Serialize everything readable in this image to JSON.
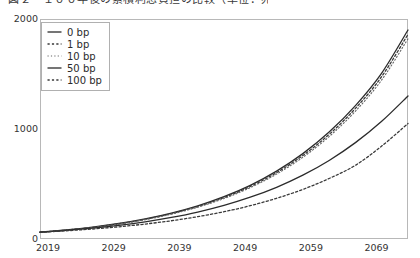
{
  "chart_data": {
    "type": "line",
    "title": "図２　１００年後の累積利息負担の比較（単位：兆円）",
    "xlabel": "",
    "ylabel": "",
    "xlim": [
      2019,
      2075
    ],
    "ylim": [
      0,
      2000
    ],
    "grid": false,
    "legend_position": "upper-left",
    "xticks": [
      "2019",
      "2029",
      "2039",
      "2049",
      "2059",
      "2069"
    ],
    "xtick_values": [
      2019,
      2029,
      2039,
      2049,
      2059,
      2069
    ],
    "yticks": [
      "0",
      "1000",
      "2000"
    ],
    "ytick_values": [
      0,
      1000,
      2000
    ],
    "x": [
      2019,
      2023,
      2027,
      2031,
      2035,
      2039,
      2043,
      2047,
      2051,
      2055,
      2059,
      2063,
      2067,
      2071,
      2075
    ],
    "series": [
      {
        "name": "0 bp",
        "style": "solid",
        "color": "#2b2b2b",
        "values": [
          62,
          82,
          108,
          141,
          183,
          236,
          302,
          385,
          488,
          617,
          776,
          972,
          1213,
          1509,
          1900
        ]
      },
      {
        "name": "1 bp",
        "style": "dotted",
        "color": "#3a3a3a",
        "values": [
          62,
          81,
          106,
          138,
          179,
          231,
          295,
          376,
          477,
          603,
          759,
          951,
          1187,
          1477,
          1860
        ]
      },
      {
        "name": "10 bp",
        "style": "dotted-fine",
        "color": "#666666",
        "values": [
          62,
          80,
          104,
          135,
          175,
          226,
          289,
          368,
          467,
          590,
          743,
          931,
          1162,
          1446,
          1820
        ]
      },
      {
        "name": "50 bp",
        "style": "solid",
        "color": "#2b2b2b",
        "values": [
          62,
          78,
          98,
          124,
          156,
          196,
          245,
          306,
          380,
          470,
          580,
          714,
          876,
          1070,
          1300
        ]
      },
      {
        "name": "100 bp",
        "style": "dotted",
        "color": "#3a3a3a",
        "values": [
          62,
          75,
          91,
          111,
          136,
          166,
          203,
          248,
          303,
          370,
          451,
          550,
          670,
          845,
          1050
        ]
      }
    ]
  },
  "axes": {
    "frame_color": "#b8b8b8",
    "tick_color": "#333333"
  }
}
